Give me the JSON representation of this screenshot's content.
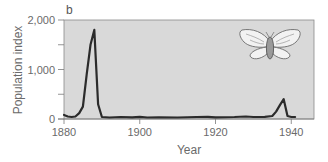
{
  "chart_data": {
    "type": "line",
    "panel_label": "b",
    "title": "",
    "xlabel": "Year",
    "ylabel": "Population index",
    "xlim": [
      1880,
      1946
    ],
    "ylim": [
      0,
      2000
    ],
    "x_ticks": [
      1880,
      1900,
      1920,
      1940
    ],
    "x_tick_labels": [
      "1880",
      "1900",
      "1920",
      "1940"
    ],
    "y_ticks": [
      0,
      500,
      1000,
      1500,
      2000
    ],
    "y_tick_labels": [
      "0",
      "",
      "1,000",
      "",
      "2,000"
    ],
    "grid": false,
    "legend": null,
    "background": "#d9d9d9",
    "line_color": "#2b2b2b",
    "annotation": "moth illustration (top-right)",
    "series": [
      {
        "name": "Population index",
        "x": [
          1880,
          1881,
          1882,
          1883,
          1884,
          1885,
          1886,
          1887,
          1888,
          1889,
          1890,
          1892,
          1895,
          1898,
          1900,
          1902,
          1905,
          1910,
          1915,
          1918,
          1920,
          1925,
          1928,
          1930,
          1933,
          1935,
          1936,
          1937,
          1938,
          1939,
          1940,
          1941
        ],
        "y": [
          80,
          50,
          40,
          50,
          120,
          250,
          900,
          1500,
          1800,
          300,
          40,
          30,
          40,
          35,
          45,
          30,
          35,
          30,
          40,
          45,
          35,
          40,
          50,
          40,
          45,
          60,
          150,
          280,
          400,
          60,
          40,
          40
        ]
      }
    ]
  }
}
